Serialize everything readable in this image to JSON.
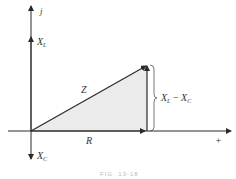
{
  "diagram": {
    "type": "impedance-triangle",
    "axes": {
      "vertical_top_label": "j",
      "horizontal_right_label": "+",
      "positive_vertical_label": "X_L",
      "negative_vertical_label": "X_C"
    },
    "vectors": {
      "resistance": "R",
      "impedance": "Z",
      "net_reactance": "X_L − X_C"
    },
    "labels": {
      "j": "j",
      "xl_main": "X",
      "xl_sub": "L",
      "xc_main": "X",
      "xc_sub": "C",
      "z": "Z",
      "r": "R",
      "plus": "+",
      "net_a_main": "X",
      "net_a_sub": "L",
      "net_minus": " − ",
      "net_b_main": "X",
      "net_b_sub": "C"
    },
    "caption": "FIG. 13-18",
    "colors": {
      "line": "#2a2a2a",
      "fill": "#ebebeb"
    }
  }
}
